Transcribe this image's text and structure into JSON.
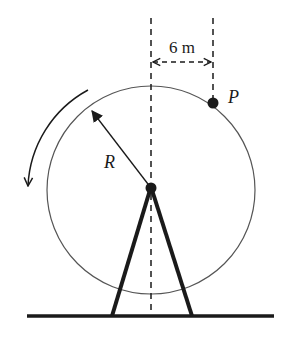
{
  "diagram": {
    "labels": {
      "distance": "6 m",
      "point": "P",
      "radius": "R"
    },
    "rotation_direction": "counterclockwise",
    "colors": {
      "stroke": "#1a1a1a",
      "circle": "#555555",
      "background": "#ffffff"
    }
  }
}
